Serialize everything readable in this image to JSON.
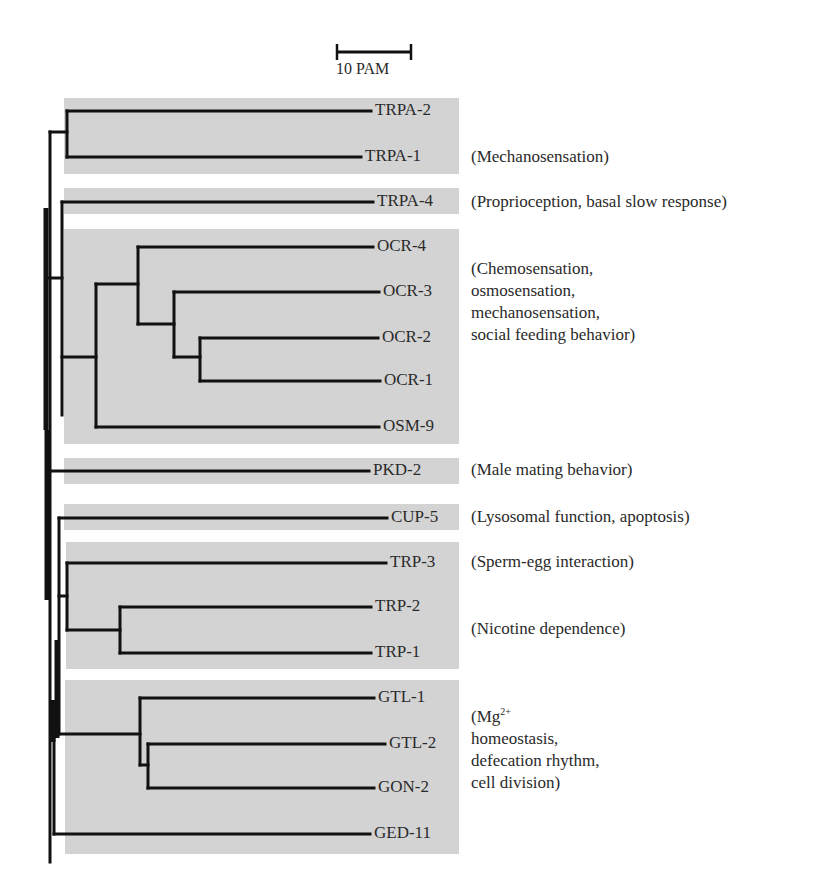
{
  "scale_bar": {
    "label": "10 PAM",
    "x1": 337,
    "x2": 411,
    "y": 52
  },
  "colors": {
    "box_fill": "#d3d3d3",
    "line": "#111111",
    "text": "#2a2a2a"
  },
  "boxes": [
    {
      "id": "trpa-12",
      "x": 64,
      "y": 98,
      "w": 395,
      "h": 76
    },
    {
      "id": "trpa-4",
      "x": 64,
      "y": 188,
      "w": 395,
      "h": 26
    },
    {
      "id": "ocr-osm",
      "x": 64,
      "y": 229,
      "w": 395,
      "h": 215
    },
    {
      "id": "pkd-2",
      "x": 64,
      "y": 458,
      "w": 395,
      "h": 26
    },
    {
      "id": "cup-5",
      "x": 64,
      "y": 504,
      "w": 395,
      "h": 26
    },
    {
      "id": "trp",
      "x": 66,
      "y": 542,
      "w": 393,
      "h": 127
    },
    {
      "id": "gtl-gon-ged",
      "x": 65,
      "y": 680,
      "w": 394,
      "h": 174
    }
  ],
  "leaves": [
    {
      "name": "TRPA-2",
      "y": 111,
      "end_x": 371
    },
    {
      "name": "TRPA-1",
      "y": 157,
      "end_x": 361
    },
    {
      "name": "TRPA-4",
      "y": 202,
      "end_x": 373
    },
    {
      "name": "OCR-4",
      "y": 247,
      "end_x": 373
    },
    {
      "name": "OCR-3",
      "y": 292,
      "end_x": 379
    },
    {
      "name": "OCR-2",
      "y": 338,
      "end_x": 378
    },
    {
      "name": "OCR-1",
      "y": 381,
      "end_x": 380
    },
    {
      "name": "OSM-9",
      "y": 427,
      "end_x": 379
    },
    {
      "name": "PKD-2",
      "y": 471,
      "end_x": 369
    },
    {
      "name": "CUP-5",
      "y": 518,
      "end_x": 387
    },
    {
      "name": "TRP-3",
      "y": 563,
      "end_x": 386
    },
    {
      "name": "TRP-2",
      "y": 607,
      "end_x": 371
    },
    {
      "name": "TRP-1",
      "y": 653,
      "end_x": 371
    },
    {
      "name": "GTL-1",
      "y": 698,
      "end_x": 374
    },
    {
      "name": "GTL-2",
      "y": 744,
      "end_x": 385
    },
    {
      "name": "GON-2",
      "y": 788,
      "end_x": 374
    },
    {
      "name": "GED-11",
      "y": 834,
      "end_x": 370
    }
  ],
  "annotations": [
    {
      "id": "mechanosensation",
      "lines": [
        "(Mechanosensation)"
      ],
      "x": 471,
      "y": 146
    },
    {
      "id": "proprioception",
      "lines": [
        "(Proprioception, basal slow response)"
      ],
      "x": 471,
      "y": 191
    },
    {
      "id": "chemosensation",
      "lines": [
        "(Chemosensation,",
        "osmosensation,",
        "mechanosensation,",
        "social feeding behavior)"
      ],
      "x": 471,
      "y": 258
    },
    {
      "id": "male-mating",
      "lines": [
        "(Male mating behavior)"
      ],
      "x": 471,
      "y": 459
    },
    {
      "id": "lysosomal",
      "lines": [
        "(Lysosomal function, apoptosis)"
      ],
      "x": 471,
      "y": 506
    },
    {
      "id": "sperm-egg",
      "lines": [
        "(Sperm-egg interaction)"
      ],
      "x": 471,
      "y": 551
    },
    {
      "id": "nicotine",
      "lines": [
        "(Nicotine dependence)"
      ],
      "x": 471,
      "y": 618
    },
    {
      "id": "mg-homeostasis",
      "lines": [
        "(Mg",
        "homeostasis,",
        "defecation rhythm,",
        "cell division)"
      ],
      "superscript": "2+",
      "x": 471,
      "y": 701
    }
  ],
  "edges": [
    [
      67,
      111,
      67,
      157
    ],
    [
      67,
      111,
      371,
      111
    ],
    [
      67,
      157,
      361,
      157
    ],
    [
      50,
      132,
      67,
      132
    ],
    [
      50,
      132,
      50,
      862
    ],
    [
      62,
      202,
      62,
      415
    ],
    [
      62,
      202,
      373,
      202
    ],
    [
      48,
      278,
      62,
      278
    ],
    [
      96,
      284,
      96,
      427
    ],
    [
      62,
      357,
      96,
      357
    ],
    [
      138,
      247,
      138,
      324
    ],
    [
      96,
      284,
      138,
      284
    ],
    [
      138,
      247,
      373,
      247
    ],
    [
      174,
      292,
      174,
      357
    ],
    [
      138,
      324,
      174,
      324
    ],
    [
      174,
      292,
      379,
      292
    ],
    [
      200,
      338,
      200,
      381
    ],
    [
      174,
      357,
      200,
      357
    ],
    [
      200,
      338,
      378,
      338
    ],
    [
      200,
      381,
      380,
      381
    ],
    [
      96,
      427,
      379,
      427
    ],
    [
      50,
      471,
      369,
      471
    ],
    [
      59,
      518,
      59,
      734
    ],
    [
      59,
      518,
      387,
      518
    ],
    [
      67,
      563,
      67,
      630
    ],
    [
      59,
      596,
      67,
      596
    ],
    [
      67,
      563,
      386,
      563
    ],
    [
      120,
      607,
      120,
      653
    ],
    [
      67,
      630,
      120,
      630
    ],
    [
      120,
      607,
      371,
      607
    ],
    [
      120,
      653,
      371,
      653
    ],
    [
      56,
      734,
      140,
      734
    ],
    [
      140,
      698,
      140,
      765
    ],
    [
      140,
      698,
      374,
      698
    ],
    [
      148,
      744,
      148,
      788
    ],
    [
      140,
      765,
      148,
      765
    ],
    [
      148,
      744,
      385,
      744
    ],
    [
      148,
      788,
      374,
      788
    ],
    [
      54,
      834,
      54,
      736
    ],
    [
      54,
      834,
      370,
      834
    ]
  ],
  "thick_trunks": [
    [
      46,
      208,
      46,
      430
    ],
    [
      47,
      430,
      47,
      600
    ],
    [
      57,
      640,
      57,
      738
    ],
    [
      53,
      700,
      53,
      742
    ]
  ]
}
